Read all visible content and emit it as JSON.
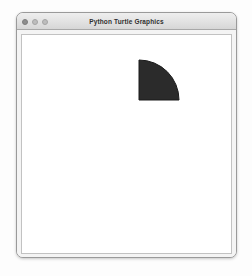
{
  "window": {
    "title": "Python Turtle Graphics",
    "controls": [
      {
        "name": "close",
        "label": "Close"
      },
      {
        "name": "minimize",
        "label": "Minimize"
      },
      {
        "name": "zoom",
        "label": "Zoom"
      }
    ]
  },
  "canvas": {
    "background_color": "#ffffff",
    "border_color": "#c2c2c2"
  },
  "drawing": {
    "description": "Filled quarter circle (quarter disc)",
    "shape_type": "quarter-circle",
    "fill_color": "#2b2b2b",
    "outline_color": "#1a1a1a",
    "outline_width": 1,
    "corner_x": 117,
    "corner_y": 65,
    "radius": 40,
    "arc_start_angle": 0,
    "arc_extent": 90,
    "path": "M 117 65 L 117 25 A 40 40 0 0 1 157 65 Z"
  }
}
